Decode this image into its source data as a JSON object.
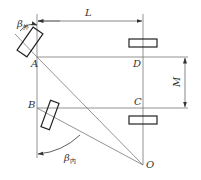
{
  "diagram": {
    "points": {
      "A": "A",
      "B": "B",
      "C": "C",
      "D": "D",
      "O": "O"
    },
    "dimensions": {
      "L": "L",
      "M": "M"
    },
    "angles": {
      "outer": {
        "symbol": "β",
        "subscript": "外"
      },
      "inner": {
        "symbol": "β",
        "subscript": "内"
      }
    },
    "colors": {
      "line": "#555555",
      "rect": "#222222",
      "background": "#ffffff"
    }
  }
}
